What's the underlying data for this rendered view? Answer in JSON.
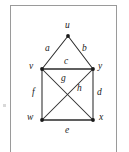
{
  "figure": {
    "type": "undirected-graph-diagram",
    "caption": "",
    "frame": {
      "border_color": "#9a9a9a",
      "background": "#ffffff"
    },
    "line_color": "#2b2b2b",
    "label_color": "#1a1a1a"
  },
  "vertices": [
    {
      "id": "u",
      "label": "u",
      "x": 68,
      "y": 36,
      "label_x": 65,
      "label_y": 21
    },
    {
      "id": "v",
      "label": "v",
      "x": 42,
      "y": 69,
      "label_x": 29,
      "label_y": 62
    },
    {
      "id": "y",
      "label": "y",
      "x": 93,
      "y": 69,
      "label_x": 98,
      "label_y": 62
    },
    {
      "id": "w",
      "label": "w",
      "x": 42,
      "y": 120,
      "label_x": 27,
      "label_y": 113
    },
    {
      "id": "x",
      "label": "x",
      "x": 93,
      "y": 120,
      "label_x": 99,
      "label_y": 113
    }
  ],
  "edges": [
    {
      "id": "a",
      "label": "a",
      "from": "u",
      "to": "v",
      "label_x": 45,
      "label_y": 44
    },
    {
      "id": "b",
      "label": "b",
      "from": "u",
      "to": "y",
      "label_x": 82,
      "label_y": 44
    },
    {
      "id": "c",
      "label": "c",
      "from": "v",
      "to": "y",
      "label_x": 64,
      "label_y": 57
    },
    {
      "id": "d",
      "label": "d",
      "from": "y",
      "to": "x",
      "label_x": 97,
      "label_y": 88
    },
    {
      "id": "e",
      "label": "e",
      "from": "w",
      "to": "x",
      "label_x": 65,
      "label_y": 126
    },
    {
      "id": "f",
      "label": "f",
      "from": "v",
      "to": "w",
      "label_x": 32,
      "label_y": 88
    },
    {
      "id": "g",
      "label": "g",
      "from": "v",
      "to": "x",
      "label_x": 61,
      "label_y": 74
    },
    {
      "id": "h",
      "label": "h",
      "from": "y",
      "to": "w",
      "label_x": 77,
      "label_y": 84
    }
  ]
}
